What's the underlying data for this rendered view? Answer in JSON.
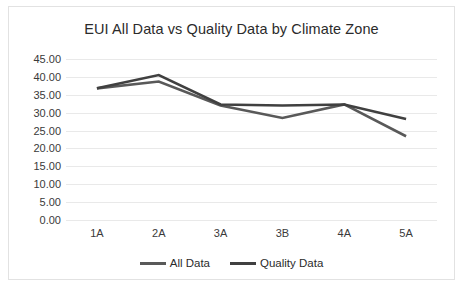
{
  "chart_data": {
    "type": "line",
    "title": "EUI All Data vs Quality Data by Climate Zone",
    "xlabel": "",
    "ylabel": "",
    "categories": [
      "1A",
      "2A",
      "3A",
      "3B",
      "4A",
      "5A"
    ],
    "series": [
      {
        "name": "All Data",
        "color": "#595959",
        "values": [
          36.8,
          38.7,
          32.0,
          28.5,
          32.3,
          23.4
        ]
      },
      {
        "name": "Quality Data",
        "color": "#404040",
        "values": [
          36.8,
          40.5,
          32.3,
          32.0,
          32.3,
          28.2
        ]
      }
    ],
    "ylim": [
      0,
      45
    ],
    "ytick_step": 5,
    "ytick_labels": [
      "45.00",
      "40.00",
      "35.00",
      "30.00",
      "25.00",
      "20.00",
      "15.00",
      "10.00",
      "5.00",
      "0.00"
    ],
    "ytick_values": [
      45,
      40,
      35,
      30,
      25,
      20,
      15,
      10,
      5,
      0
    ],
    "grid": true,
    "legend_position": "bottom",
    "frame_color": "#e2e2e2",
    "gridline_color": "#e9e9e9",
    "background_color": "#ffffff"
  }
}
